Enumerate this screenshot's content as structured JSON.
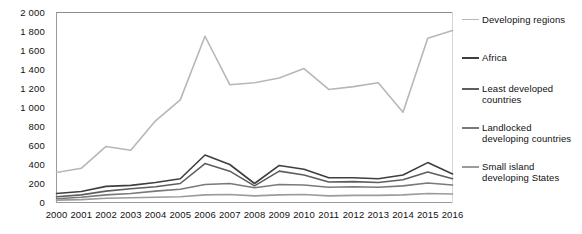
{
  "chart_data": {
    "type": "line",
    "title": "",
    "subtitle": "",
    "xlabel": "",
    "ylabel": "",
    "x": [
      2000,
      2001,
      2002,
      2003,
      2004,
      2005,
      2006,
      2007,
      2008,
      2009,
      2010,
      2011,
      2012,
      2013,
      2014,
      2015,
      2016
    ],
    "xtick_labels": [
      "2000",
      "2001",
      "2002",
      "2003",
      "2004",
      "2005",
      "2006",
      "2007",
      "2008",
      "2009",
      "2010",
      "2011",
      "2012",
      "2013",
      "2014",
      "2015",
      "2016"
    ],
    "ytick_labels": [
      "0",
      "200",
      "400",
      "600",
      "800",
      "1 000",
      "1 200",
      "1 400",
      "1 600",
      "1 800",
      "2 000"
    ],
    "ytick_values": [
      0,
      200,
      400,
      600,
      800,
      1000,
      1200,
      1400,
      1600,
      1800,
      2000
    ],
    "ylim": [
      0,
      2000
    ],
    "grid": false,
    "legend_position": "right",
    "series": [
      {
        "name": "Developing regions",
        "color": "#b7b7b7",
        "width": 1.6,
        "values": [
          315,
          360,
          590,
          550,
          860,
          1080,
          1750,
          1240,
          1260,
          1310,
          1410,
          1190,
          1220,
          1260,
          950,
          1730,
          1810
        ]
      },
      {
        "name": "Africa",
        "color": "#3f3f3f",
        "width": 1.6,
        "values": [
          95,
          115,
          170,
          180,
          210,
          250,
          500,
          400,
          200,
          390,
          350,
          260,
          260,
          250,
          290,
          420,
          300
        ]
      },
      {
        "name": "Least developed countries",
        "color": "#5e5e5e",
        "width": 1.6,
        "values": [
          60,
          80,
          120,
          145,
          165,
          200,
          410,
          330,
          175,
          330,
          290,
          215,
          220,
          210,
          240,
          320,
          250
        ]
      },
      {
        "name": "Landlocked developing countries",
        "color": "#7a7a7a",
        "width": 1.6,
        "values": [
          40,
          55,
          80,
          95,
          120,
          140,
          190,
          200,
          155,
          190,
          185,
          160,
          165,
          160,
          175,
          205,
          185
        ]
      },
      {
        "name": "Small island developing States",
        "color": "#9b9b9b",
        "width": 1.6,
        "values": [
          25,
          30,
          45,
          50,
          55,
          60,
          80,
          85,
          70,
          80,
          85,
          70,
          75,
          75,
          80,
          95,
          90
        ]
      }
    ]
  },
  "legend": {
    "items": [
      {
        "label": "Developing regions"
      },
      {
        "label": "Africa"
      },
      {
        "label": "Least developed\ncountries"
      },
      {
        "label": "Landlocked\ndeveloping countries"
      },
      {
        "label": "Small island\ndeveloping States"
      }
    ]
  },
  "plot": {
    "frame_color": "#d6d6d6",
    "axis_color": "#9a9a9a",
    "background": "#ffffff"
  }
}
